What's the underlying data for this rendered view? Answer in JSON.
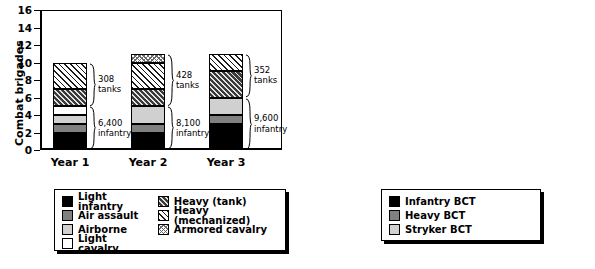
{
  "chart_data": [
    {
      "id": "combat-brigades",
      "type": "bar",
      "subtype": "stacked",
      "title": "",
      "xlabel": "",
      "ylabel": "Combat brigades",
      "ylim": [
        0,
        16
      ],
      "yticks": [
        0,
        2,
        4,
        6,
        8,
        10,
        12,
        14,
        16
      ],
      "grid": false,
      "legend_position": "below-left",
      "categories": [
        "Year 1",
        "Year 2",
        "Year 3"
      ],
      "series": [
        {
          "name": "Light infantry",
          "swatch": "black",
          "values": [
            2,
            2,
            3
          ]
        },
        {
          "name": "Air assault",
          "swatch": "dgray",
          "values": [
            1,
            1,
            1
          ]
        },
        {
          "name": "Airborne",
          "swatch": "lgray",
          "values": [
            1,
            2,
            2
          ]
        },
        {
          "name": "Light cavalry",
          "swatch": "white",
          "values": [
            1,
            0,
            0
          ]
        },
        {
          "name": "Heavy (tank)",
          "swatch": "tank",
          "values": [
            2,
            2,
            3
          ]
        },
        {
          "name": "Heavy (mechanized)",
          "swatch": "mech",
          "values": [
            3,
            3,
            2
          ]
        },
        {
          "name": "Armored cavalry",
          "swatch": "cav",
          "values": [
            0,
            1,
            0
          ]
        }
      ],
      "totals": [
        10,
        11,
        11
      ],
      "annotations": [
        {
          "category": "Year 1",
          "group": "tanks",
          "text": "308\ntanks",
          "from": 5,
          "to": 10
        },
        {
          "category": "Year 1",
          "group": "infantry",
          "text": "6,400\ninfantry",
          "from": 0,
          "to": 5
        },
        {
          "category": "Year 2",
          "group": "tanks",
          "text": "428\ntanks",
          "from": 5,
          "to": 11
        },
        {
          "category": "Year 2",
          "group": "infantry",
          "text": "8,100\ninfantry",
          "from": 0,
          "to": 5
        },
        {
          "category": "Year 3",
          "group": "tanks",
          "text": "352\ntanks",
          "from": 6,
          "to": 11
        },
        {
          "category": "Year 3",
          "group": "infantry",
          "text": "9,600\ninfantry",
          "from": 0,
          "to": 6
        }
      ]
    },
    {
      "id": "bcts",
      "type": "bar",
      "subtype": "stacked",
      "title": "",
      "xlabel": "",
      "ylabel": "BCTs",
      "ylim": [
        0,
        16
      ],
      "yticks": [
        0,
        2,
        4,
        6,
        8,
        10,
        12,
        14,
        16
      ],
      "grid": false,
      "legend_position": "below-right",
      "categories": [
        "Year 1",
        "Year 2",
        "Year 3"
      ],
      "series": [
        {
          "name": "Infantry BCT",
          "swatch": "black",
          "values": [
            7,
            7,
            8
          ]
        },
        {
          "name": "Heavy BCT",
          "swatch": "dgray",
          "values": [
            6,
            6,
            5
          ]
        },
        {
          "name": "Stryker BCT",
          "swatch": "lgray",
          "values": [
            2.2,
            2,
            2
          ]
        }
      ],
      "totals": [
        15.2,
        15,
        15
      ],
      "annotations": [
        {
          "category": "Year 1",
          "group": "tanks",
          "text": "348\ntanks",
          "from": 7,
          "to": 13
        },
        {
          "category": "Year 1",
          "group": "infantry",
          "text": "8,400\ninfantry",
          "from": 0,
          "to": 7
        },
        {
          "category": "Year 2",
          "group": "tanks",
          "text": "348\ntanks",
          "from": 7,
          "to": 13
        },
        {
          "category": "Year 2",
          "group": "infantry",
          "text": "8,400\ninfantry",
          "from": 0,
          "to": 7
        },
        {
          "category": "Year 3",
          "group": "tanks",
          "text": "290\ntanks",
          "from": 8,
          "to": 13
        },
        {
          "category": "Year 3",
          "group": "infantry",
          "text": "9,600\ninfantry",
          "from": 0,
          "to": 8
        }
      ]
    }
  ],
  "left_chart": {
    "ylabel": "Combat brigades",
    "yticks": [
      "16",
      "14",
      "12",
      "10",
      "8",
      "6",
      "4",
      "2",
      "0"
    ],
    "xticks": [
      "Year 1",
      "Year 2",
      "Year 3"
    ],
    "annotations": {
      "y1_tanks": "308\ntanks",
      "y1_infantry": "6,400\ninfantry",
      "y2_tanks": "428\ntanks",
      "y2_infantry": "8,100\ninfantry",
      "y3_tanks": "352\ntanks",
      "y3_infantry": "9,600\ninfantry"
    },
    "legend": {
      "column_a": [
        "Light infantry",
        "Air assault",
        "Airborne",
        "Light cavalry"
      ],
      "column_b": [
        "Heavy (tank)",
        "Heavy (mechanized)",
        "Armored cavalry"
      ]
    }
  },
  "right_chart": {
    "ylabel": "BCTs",
    "yticks": [
      "16",
      "14",
      "12",
      "10",
      "8",
      "6",
      "4",
      "2",
      "0"
    ],
    "xticks": [
      "Year 1",
      "Year 2",
      "Year 3"
    ],
    "annotations": {
      "y1_tanks": "348\ntanks",
      "y1_infantry": "8,400\ninfantry",
      "y2_tanks": "348\ntanks",
      "y2_infantry": "8,400\ninfantry",
      "y3_tanks": "290\ntanks",
      "y3_infantry": "9,600\ninfantry"
    },
    "legend": [
      "Infantry BCT",
      "Heavy BCT",
      "Stryker BCT"
    ]
  },
  "colors": {
    "black": "#000000",
    "dark_gray": "#808080",
    "light_gray": "#d0d0d0",
    "white": "#ffffff"
  }
}
